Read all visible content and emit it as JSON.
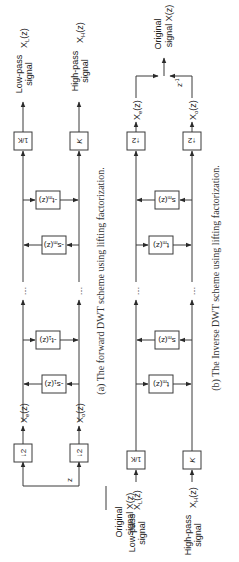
{
  "figure": {
    "orientation": "rotated-90-ccw",
    "colors": {
      "line": "#3a3a3a",
      "text": "#222222",
      "background": "#ffffff"
    },
    "panels": [
      {
        "id": "a",
        "caption": "(a) The forward DWT scheme using lifting factorization.",
        "input": {
          "line1": "Original",
          "line2": "signal X(z)"
        },
        "delay_label": "z",
        "downsamplers": [
          "↓2",
          "↓2"
        ],
        "even_label": "X",
        "even_sub": "e",
        "odd_label": "X",
        "odd_sub": "o",
        "zsuffix": "(z)",
        "stages": [
          {
            "top": "-s₁(z)",
            "top_base": "-s",
            "top_sub": "1",
            "bottom_base": "-t",
            "bottom_sub": "1"
          },
          {
            "top_base": "-s",
            "top_sub": "m",
            "bottom_base": "-t",
            "bottom_sub": "m"
          }
        ],
        "ellipsis": "…",
        "scale_top": "1/K",
        "scale_bottom": "K",
        "output_low": {
          "line1": "Low-pass",
          "line2": "signal",
          "label": "X",
          "sub": "L",
          "suffix": "(z)"
        },
        "output_high": {
          "line1": "High-pass",
          "line2": "signal",
          "label": "X",
          "sub": "H",
          "suffix": "(z)"
        }
      },
      {
        "id": "b",
        "caption": "(b) The Inverse DWT scheme using lifting factorization.",
        "input_low": {
          "line1": "Low-pass",
          "line2": "signal",
          "label": "X",
          "sub": "L",
          "suffix": "(z)"
        },
        "input_high": {
          "line1": "High-pass",
          "line2": "signal",
          "label": "X",
          "sub": "H",
          "suffix": "(z)"
        },
        "scale_top": "1/K",
        "scale_bottom": "K",
        "stages": [
          {
            "first_base": "t",
            "first_sub": "m",
            "second_base": "s",
            "second_sub": "m"
          },
          {
            "first_base": "t",
            "first_sub": "m",
            "second_base": "s",
            "second_sub": "m"
          }
        ],
        "ellipsis": "…",
        "upsamplers": [
          "↑2",
          "↑2"
        ],
        "even_label": "X",
        "even_sub": "e",
        "odd_label": "X",
        "odd_sub": "o",
        "zsuffix": "(z)",
        "delay_label": "z",
        "delay_exp": "-1",
        "output": {
          "line1": "Original",
          "line2": "signal X(z)"
        }
      }
    ]
  }
}
